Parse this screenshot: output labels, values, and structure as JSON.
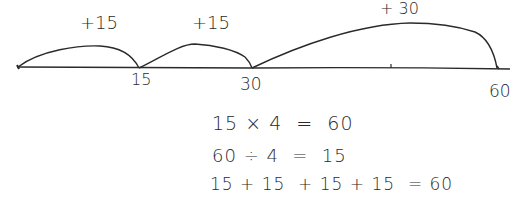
{
  "number_line": {
    "ticks": [
      {
        "label": "15",
        "value": 15
      },
      {
        "label": "30",
        "value": 30
      },
      {
        "label": "60",
        "value": 60
      }
    ],
    "start_value": 0,
    "jumps": [
      {
        "label": "+15",
        "from": 0,
        "to": 15
      },
      {
        "label": "+15",
        "from": 15,
        "to": 30
      },
      {
        "label": "+ 30",
        "from": 30,
        "to": 60
      }
    ]
  },
  "equations": [
    "15 × 4  =  60",
    "60 ÷ 4  =  15",
    "15 + 15  + 15 + 15  = 60"
  ],
  "colors": {
    "ink": "#2a2a2a",
    "background": "#ffffff"
  }
}
